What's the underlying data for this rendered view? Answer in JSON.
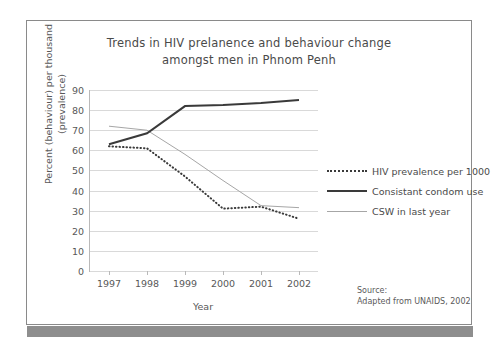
{
  "chart_data": {
    "type": "line",
    "title": "Trends in HIV prelanence and behaviour change amongst men in Phnom Penh",
    "title_line1": "Trends in HIV prelanence and behaviour change",
    "title_line2": "amongst men in Phnom Penh",
    "xlabel": "Year",
    "ylabel": "Percent (behaviour) per thousand (prevalence)",
    "ylabel_line1": "Percent (behaviour) per thousand",
    "ylabel_line2": "(prevalence)",
    "categories": [
      "1997",
      "1998",
      "1999",
      "2000",
      "2001",
      "2002"
    ],
    "x": [
      1997,
      1998,
      1999,
      2000,
      2001,
      2002
    ],
    "ylim": [
      0,
      90
    ],
    "yticks": [
      0,
      10,
      20,
      30,
      40,
      50,
      60,
      70,
      80,
      90
    ],
    "grid": "horizontal",
    "legend_position": "right",
    "series": [
      {
        "name": "HIV prevalence per 1000",
        "style": "dotted",
        "color": "#3a3a3a",
        "values": [
          62,
          61,
          47,
          31,
          32,
          26
        ]
      },
      {
        "name": "Consistant condom use",
        "style": "solid-thick",
        "color": "#3a3a3a",
        "values": [
          63,
          68.5,
          82,
          82.5,
          83.5,
          85
        ]
      },
      {
        "name": "CSW in last year",
        "style": "solid-thin",
        "color": "#a6a6a6",
        "values": [
          72,
          70,
          58,
          45,
          32.5,
          31.5
        ]
      }
    ],
    "annotations": {
      "source_label": "Source:",
      "source_text": "Adapted from UNAIDS, 2002"
    }
  }
}
